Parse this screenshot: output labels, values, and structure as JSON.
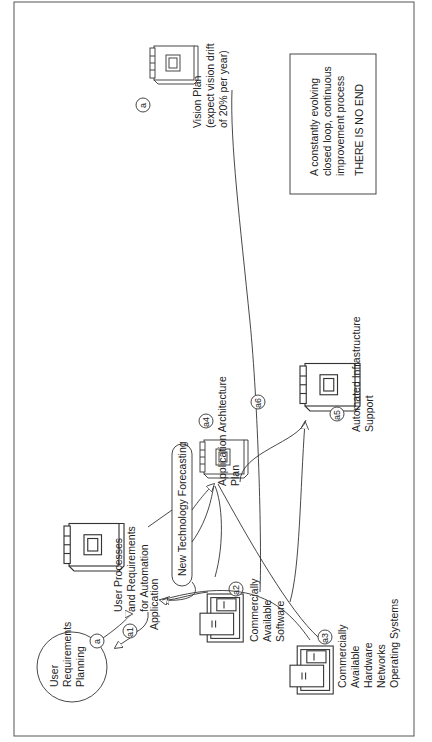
{
  "diagram": {
    "orientation": "rotated-90-ccw",
    "nodes": {
      "user_requirements_planning": {
        "label_lines": [
          "User",
          "Requirements",
          "Planning"
        ],
        "badge": "a"
      },
      "user_processes": {
        "label_lines": [
          "User Processes",
          "and Requirements",
          "for Automation"
        ]
      },
      "application": {
        "label": "Application",
        "badge": "a1"
      },
      "new_technology_forecasting": {
        "label": "New Technology Forecasting"
      },
      "application_architecture_plan": {
        "label_lines": [
          "Application   Architecture",
          "Plan"
        ],
        "badge": "a4"
      },
      "commercially_available_software": {
        "label_lines": [
          "Commercially",
          "Available",
          "Software"
        ],
        "badge": "a2"
      },
      "commercially_available_hardware": {
        "label_lines": [
          "Commercially",
          "Available",
          "Hardware",
          "Networks",
          "Operating Systems"
        ],
        "badge": "a3"
      },
      "automated_infrastructure_support": {
        "label_lines": [
          "Automated Infrastructure",
          "Support"
        ],
        "badge": "a5"
      },
      "vision_plan": {
        "label_lines": [
          "Vision Plan",
          "(expect vision drift",
          "of 20% per year)"
        ],
        "badge": "a"
      },
      "link_badge": "a6"
    },
    "note_box": {
      "lines": [
        "A constantly evolving",
        "closed loop, continuous",
        "improvement process"
      ],
      "emphasis": "THERE IS NO END"
    }
  },
  "colors": {
    "ink": "#333333",
    "background": "#ffffff",
    "border": "#555555"
  }
}
